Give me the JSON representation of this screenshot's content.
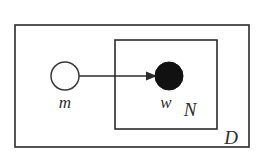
{
  "diagram": {
    "type": "plate-notation-graphical-model",
    "background_color": "#ffffff",
    "stroke_color": "#2b2b2b",
    "observed_node_color": "#111111",
    "latent_node_color": "#ffffff",
    "plates": [
      {
        "id": "outer-plate",
        "label": "D",
        "label_position": "bottom-right-inside",
        "x": 15,
        "y": 25,
        "width": 234,
        "height": 122
      },
      {
        "id": "inner-plate",
        "label": "N",
        "label_position": "bottom-right-inside",
        "x": 115,
        "y": 40,
        "width": 102,
        "height": 89
      }
    ],
    "nodes": [
      {
        "id": "node-m",
        "label": "m",
        "style": "open",
        "observed": false,
        "cx": 65,
        "cy": 76,
        "r": 14,
        "label_x": 65,
        "label_y": 106
      },
      {
        "id": "node-w",
        "label": "w",
        "style": "filled",
        "observed": true,
        "cx": 169,
        "cy": 76,
        "r": 14,
        "label_x": 166,
        "label_y": 106
      }
    ],
    "edges": [
      {
        "id": "edge-m-to-w",
        "from": "node-m",
        "to": "node-w",
        "directed": true,
        "x1": 79,
        "y1": 76,
        "x2": 155,
        "y2": 76
      }
    ],
    "plate_label_positions": {
      "N": {
        "x": 196,
        "y": 115
      },
      "D": {
        "x": 231,
        "y": 143
      }
    }
  }
}
